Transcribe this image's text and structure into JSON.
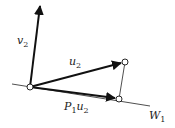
{
  "diagram": {
    "labels": {
      "v2": {
        "main": "v",
        "sub": "2"
      },
      "u2": {
        "main": "u",
        "sub": "2"
      },
      "p1u2": {
        "main1": "P",
        "sub1": "1",
        "main2": "u",
        "sub2": "2"
      },
      "w1": {
        "main": "W",
        "sub": "1"
      }
    },
    "colors": {
      "stroke": "#111111",
      "point_fill": "#ffffff",
      "label": "#222222"
    },
    "points": {
      "origin": [
        30,
        87
      ],
      "v2_tip": [
        40,
        5
      ],
      "u2_tip": [
        125,
        62
      ],
      "p1u2_tip": [
        119,
        99
      ]
    },
    "line_W1": {
      "from": [
        12,
        84
      ],
      "to": [
        150,
        106
      ]
    }
  }
}
